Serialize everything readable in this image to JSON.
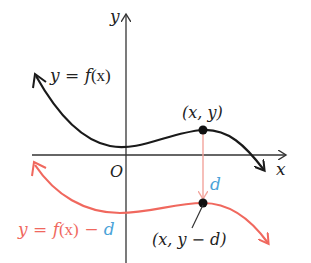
{
  "diagram": {
    "axes": {
      "x_label": "x",
      "y_label": "y",
      "origin_label": "O"
    },
    "curves": [
      {
        "name": "original",
        "label_lhs": "y = ",
        "label_f": "f",
        "label_arg": "(x)",
        "color": "#1a1a1a"
      },
      {
        "name": "shifted",
        "label_lhs": "y = ",
        "label_f": "f",
        "label_arg": "(x)",
        "label_minus": " − ",
        "label_d": "d",
        "color": "#f0685e"
      }
    ],
    "points": {
      "original_point": "(x, y)",
      "shifted_point": "(x, y − d)"
    },
    "shift_label": "d",
    "colors": {
      "axis": "#333333",
      "black_curve": "#1a1a1a",
      "red_curve": "#f0685e",
      "shift_arrow": "#f2a49c",
      "d_blue": "#4aa3d8",
      "point": "#111111"
    }
  }
}
